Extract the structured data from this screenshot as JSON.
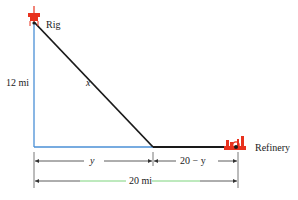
{
  "diagram": {
    "labels": {
      "rig": "Rig",
      "refinery": "Refinery",
      "vertical_distance": "12 mi",
      "hypotenuse": "x",
      "segment_left": "y",
      "segment_right": "20 − y",
      "total_distance": "20 mi"
    },
    "colors": {
      "shore_lines": "#4a8fd6",
      "pipeline": "#1a1a1a",
      "icons": "#e8321e",
      "dimension": "#333333",
      "total_accent": "#5cc85c"
    }
  }
}
